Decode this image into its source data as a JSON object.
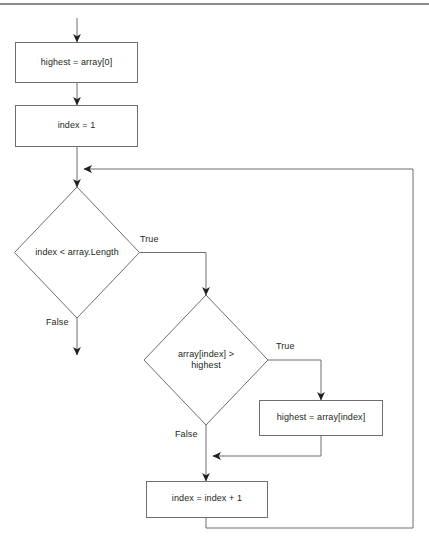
{
  "diagram": {
    "type": "flowchart",
    "colors": {
      "stroke": "#6d6e71",
      "arrow_fill": "#231f20",
      "text": "#231f20",
      "rule": "#8a8c8e",
      "background": "#ffffff"
    },
    "top_rule": {
      "present": true
    },
    "nodes": [
      {
        "id": "assign-highest-first",
        "shape": "process",
        "label": "highest = array[0]"
      },
      {
        "id": "assign-index-one",
        "shape": "process",
        "label": "index = 1"
      },
      {
        "id": "decision-index-less-length",
        "shape": "decision",
        "label": "index < array.Length"
      },
      {
        "id": "decision-array-greater-highest",
        "shape": "decision",
        "label_line1": "array[index] >",
        "label_line2": "highest"
      },
      {
        "id": "assign-highest-current",
        "shape": "process",
        "label": "highest = array[index]"
      },
      {
        "id": "increment-index",
        "shape": "process",
        "label": "index = index + 1"
      }
    ],
    "branch_labels": {
      "loop_true": "True",
      "loop_false": "False",
      "compare_true": "True",
      "compare_false": "False"
    }
  }
}
